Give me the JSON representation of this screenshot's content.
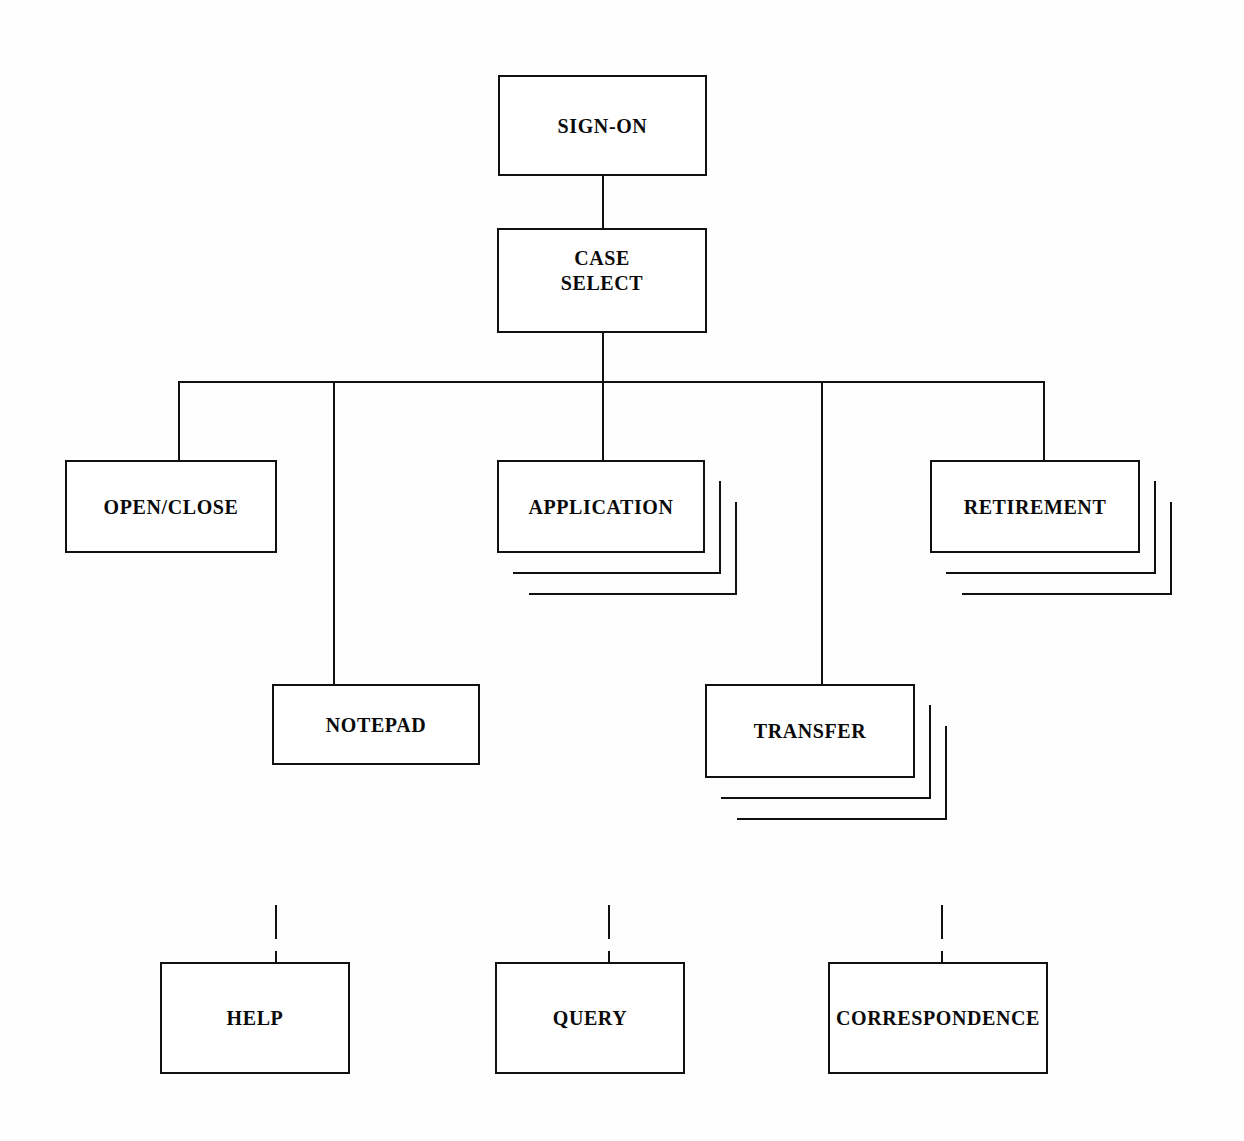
{
  "diagram": {
    "type": "tree-diagram",
    "background_color": "#fefefe",
    "line_color": "#111111",
    "text_color": "#0a0a0a",
    "nodes": {
      "sign_on": {
        "label": "SIGN-ON"
      },
      "case_select": {
        "label_line1": "CASE",
        "label_line2": "SELECT"
      },
      "open_close": {
        "label": "OPEN/CLOSE"
      },
      "application": {
        "label": "APPLICATION"
      },
      "retirement": {
        "label": "RETIREMENT"
      },
      "notepad": {
        "label": "NOTEPAD"
      },
      "transfer": {
        "label": "TRANSFER"
      },
      "help": {
        "label": "HELP"
      },
      "query": {
        "label": "QUERY"
      },
      "correspondence": {
        "label": "CORRESPONDENCE"
      }
    }
  }
}
